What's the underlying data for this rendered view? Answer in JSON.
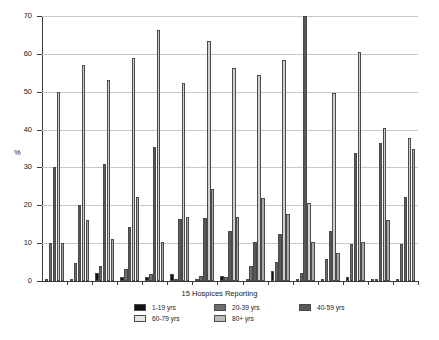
{
  "chart_data": {
    "type": "bar",
    "title": "",
    "xlabel": "15 Hospices Reporting",
    "ylabel": "%",
    "ylim": [
      0,
      70
    ],
    "yticks": [
      0,
      10,
      20,
      30,
      40,
      50,
      60,
      70
    ],
    "ytick_labels": [
      "0",
      "10",
      "20",
      "30",
      "40",
      "50",
      "60",
      "70"
    ],
    "grid": true,
    "legend_position": "bottom",
    "categories": [
      "1",
      "2",
      "3",
      "4",
      "5",
      "6",
      "7",
      "8",
      "9",
      "10",
      "11",
      "12",
      "13",
      "14",
      "15"
    ],
    "series": [
      {
        "name": "1-19 yrs",
        "color": "#111111",
        "values": [
          0.3,
          0.3,
          2.0,
          1.0,
          1.1,
          1.8,
          0.3,
          1.2,
          0.4,
          2.6,
          0.5,
          0.3,
          1.0,
          0.3,
          0.4
        ]
      },
      {
        "name": "20-39 yrs",
        "color": "#6e6e6e",
        "values": [
          10.0,
          4.8,
          4.0,
          3.2,
          1.9,
          0.3,
          1.2,
          1.0,
          4.0,
          5.0,
          2.0,
          5.8,
          9.9,
          0.4,
          9.7
        ]
      },
      {
        "name": "40-59 yrs",
        "color": "#585858",
        "values": [
          30.0,
          20.1,
          31.0,
          14.2,
          35.4,
          16.3,
          16.6,
          13.2,
          10.4,
          12.5,
          70.0,
          13.3,
          33.7,
          36.5,
          22.3
        ]
      },
      {
        "name": "60-79 yrs",
        "color": "#d0d0d0",
        "values": [
          50.0,
          57.0,
          53.2,
          58.8,
          66.2,
          52.2,
          63.3,
          56.3,
          54.4,
          58.3,
          20.6,
          49.7,
          60.6,
          40.5,
          37.8
        ]
      },
      {
        "name": "80+ yrs",
        "color": "#a8a8a8",
        "values": [
          10.0,
          16.1,
          11.1,
          22.1,
          10.2,
          16.8,
          24.2,
          16.8,
          21.8,
          17.7,
          10.2,
          7.4,
          10.2,
          16.0,
          34.8
        ]
      }
    ]
  },
  "legend": {
    "items": [
      {
        "label": "1-19 yrs",
        "color": "#111111"
      },
      {
        "label": "20-39 yrs",
        "color": "#6e6e6e"
      },
      {
        "label": "40-59 yrs",
        "color": "#585858"
      },
      {
        "label": "60-79 yrs",
        "color": "#e6e6e6"
      },
      {
        "label": "80+ yrs",
        "color": "#bdbdbd"
      }
    ]
  }
}
